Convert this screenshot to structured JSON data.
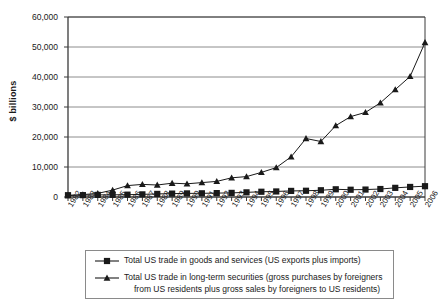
{
  "chart_data": {
    "type": "line",
    "title": "",
    "xlabel": "",
    "ylabel": "$ billions",
    "ylim": [
      0,
      60000
    ],
    "ytick_labels": [
      "60,000",
      "50,000",
      "40,000",
      "30,000",
      "20,000",
      "10,000",
      "0"
    ],
    "ytick_values": [
      60000,
      50000,
      40000,
      30000,
      20000,
      10000,
      0
    ],
    "grid": true,
    "legend_position": "bottom",
    "categories": [
      "1982",
      "1983",
      "1984",
      "1985",
      "1986",
      "1987",
      "1988",
      "1989",
      "1990",
      "1991",
      "1992",
      "1993",
      "1994",
      "1995",
      "1996",
      "1997",
      "1998",
      "1999",
      "2000",
      "2001",
      "2002",
      "2003",
      "2004",
      "2005",
      "2006"
    ],
    "series": [
      {
        "name": "Total US trade in goods and services (US exports plus imports)",
        "marker": "square",
        "values": [
          600,
          620,
          700,
          720,
          780,
          880,
          1030,
          1130,
          1200,
          1230,
          1300,
          1370,
          1550,
          1750,
          1850,
          2030,
          2080,
          2250,
          2570,
          2420,
          2480,
          2660,
          3050,
          3350,
          3600
        ]
      },
      {
        "name": "Total US trade in long-term securities (gross purchases by foreigners from US residents plus gross sales by foreigners to US residents)",
        "marker": "triangle",
        "values": [
          450,
          800,
          1200,
          2300,
          3800,
          4200,
          4000,
          4600,
          4400,
          4800,
          5200,
          6400,
          6800,
          8200,
          9800,
          13400,
          19500,
          18500,
          23800,
          26800,
          28200,
          31400,
          35800,
          40200,
          51500
        ]
      }
    ]
  },
  "legend": {
    "entries": [
      {
        "marker": "square-marker",
        "label": "Total US trade in goods and services (US exports plus imports)"
      },
      {
        "marker": "triangle-marker",
        "label_line1": "Total US trade in long-term securities (gross purchases by foreigners",
        "label_line2": "from US residents plus gross sales by foreigners to US residents)"
      }
    ]
  },
  "colors": {
    "line": "#1a1a1a",
    "grid": "#8c8c8c",
    "axis": "#3a3a3a",
    "background": "#ffffff"
  }
}
